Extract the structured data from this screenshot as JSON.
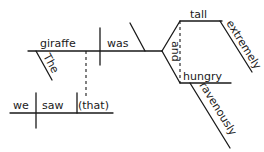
{
  "diagram": {
    "type": "sentence-diagram",
    "main_clause": {
      "subject": "giraffe",
      "subject_modifier": "The",
      "verb": "was",
      "predicate_adjectives": [
        {
          "word": "tall",
          "modifier": "extremely"
        },
        {
          "word": "hungry",
          "modifier": "ravenously"
        }
      ],
      "conjunction": "and"
    },
    "relative_clause": {
      "subject": "we",
      "verb": "saw",
      "object": "(that)"
    }
  }
}
